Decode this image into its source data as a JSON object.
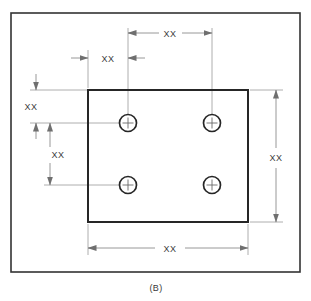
{
  "figure": {
    "label": "(B)",
    "caption_position": "bottom-center",
    "border_color": "#333333",
    "part_outline_color": "#262626",
    "dimension_line_color": "#8c8c8c",
    "text_color": "#3a3a3a",
    "background_color": "#ffffff"
  },
  "part": {
    "name": "rectangular-plate",
    "hole_count": 4,
    "hole_marker": "center-cross"
  },
  "dimensions": [
    {
      "id": "hole-spacing-horizontal",
      "value": "XX",
      "orientation": "horizontal",
      "arrow_style": "inside",
      "describes": "horizontal distance between the two hole centerlines"
    },
    {
      "id": "edge-to-first-hole-horizontal",
      "value": "XX",
      "orientation": "horizontal",
      "arrow_style": "outside",
      "describes": "distance from left edge of plate to first hole centerline"
    },
    {
      "id": "top-edge-to-first-hole-vertical",
      "value": "XX",
      "orientation": "vertical",
      "arrow_style": "outside",
      "describes": "distance from top edge of plate to upper hole centerline"
    },
    {
      "id": "hole-spacing-vertical",
      "value": "XX",
      "orientation": "vertical",
      "arrow_style": "inside",
      "describes": "vertical distance between upper and lower hole centerlines"
    },
    {
      "id": "plate-height",
      "value": "XX",
      "orientation": "vertical",
      "arrow_style": "inside",
      "describes": "overall height of the plate"
    },
    {
      "id": "plate-width",
      "value": "XX",
      "orientation": "horizontal",
      "arrow_style": "inside",
      "describes": "overall width of the plate"
    }
  ]
}
